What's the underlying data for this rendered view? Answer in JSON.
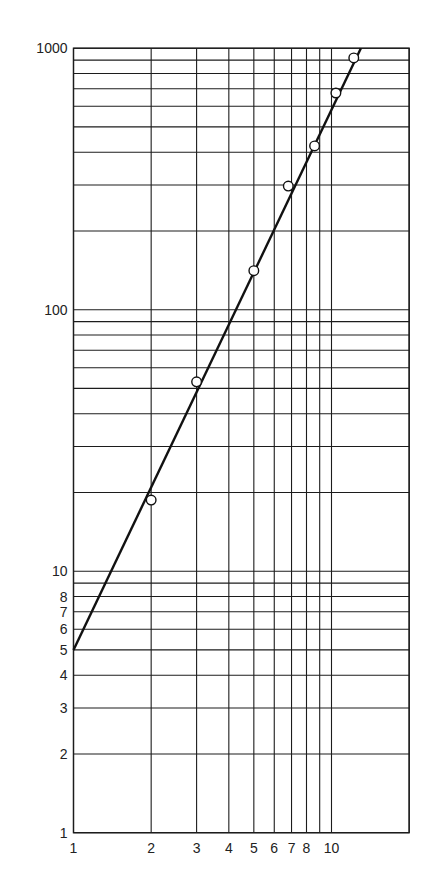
{
  "chart_data": {
    "type": "scatter",
    "title": "",
    "xlabel": "",
    "ylabel": "",
    "xscale": "log",
    "yscale": "log",
    "xlim": [
      1,
      20
    ],
    "ylim": [
      1,
      1000
    ],
    "grid": true,
    "legend": null,
    "x_tick_labels": [
      "1",
      "2",
      "3",
      "4",
      "5",
      "6",
      "7",
      "8",
      "10"
    ],
    "x_tick_values": [
      1,
      2,
      3,
      4,
      5,
      6,
      7,
      8,
      10
    ],
    "x_gridlines": [
      1,
      2,
      3,
      4,
      5,
      6,
      7,
      8,
      9,
      10,
      20
    ],
    "y_tick_labels": [
      "1",
      "2",
      "3",
      "4",
      "5",
      "6",
      "7",
      "8",
      "10",
      "100",
      "1000"
    ],
    "y_tick_values": [
      1,
      2,
      3,
      4,
      5,
      6,
      7,
      8,
      10,
      100,
      1000
    ],
    "y_gridlines": [
      1,
      2,
      3,
      4,
      5,
      6,
      7,
      8,
      9,
      10,
      20,
      30,
      40,
      50,
      60,
      70,
      80,
      90,
      100,
      200,
      300,
      400,
      500,
      600,
      700,
      800,
      900,
      1000
    ],
    "series": [
      {
        "name": "data points",
        "marker": "open-circle",
        "x": [
          2,
          3,
          5,
          6.8,
          8.6,
          10.4,
          12.2
        ],
        "y": [
          18.7,
          53,
          141,
          297,
          423,
          674,
          918
        ]
      },
      {
        "name": "fit line",
        "style": "solid-line",
        "equation": "y = 5 * x^2.09",
        "x": [
          1,
          13.0
        ],
        "y": [
          5,
          1000
        ]
      }
    ]
  },
  "colors": {
    "background": "#ffffff",
    "ink": "#1c1c1c"
  }
}
